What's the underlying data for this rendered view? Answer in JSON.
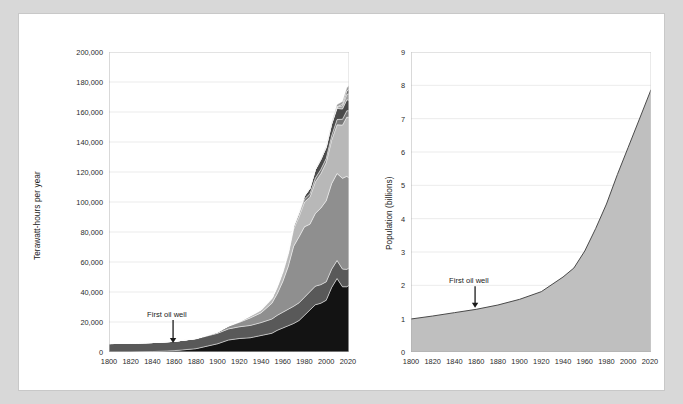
{
  "figure": {
    "background_color": "#d8d8d8",
    "panel_color": "#ffffff",
    "panel_border_color": "#c8c8c8"
  },
  "chart_data": [
    {
      "id": "energy",
      "type": "area",
      "stacked": true,
      "title": "",
      "xlabel": "",
      "ylabel": "Terawatt-hours per year",
      "xlim": [
        1800,
        2021
      ],
      "ylim": [
        0,
        200000
      ],
      "grid": true,
      "legend": "none",
      "xticks": [
        1800,
        1820,
        1840,
        1860,
        1880,
        1900,
        1920,
        1940,
        1960,
        1980,
        2000,
        2020
      ],
      "xticklabels": [
        "1800",
        "1820",
        "1840",
        "1860",
        "1880",
        "1900",
        "1920",
        "1940",
        "1960",
        "1980",
        "2000",
        "2020"
      ],
      "yticks": [
        0,
        20000,
        40000,
        60000,
        80000,
        100000,
        120000,
        140000,
        160000,
        180000,
        200000
      ],
      "yticklabels": [
        "0",
        "20,000",
        "40,000",
        "60,000",
        "80,000",
        "100,000",
        "120,000",
        "140,000",
        "160,000",
        "180,000",
        "200,000"
      ],
      "annotations": [
        {
          "text": "First oil well",
          "x": 1859,
          "y": 22000,
          "arrow": "down",
          "arrow_to_y": 6000
        }
      ],
      "x": [
        1800,
        1820,
        1840,
        1860,
        1880,
        1900,
        1910,
        1920,
        1930,
        1940,
        1950,
        1955,
        1960,
        1965,
        1970,
        1975,
        1980,
        1985,
        1990,
        1995,
        2000,
        2005,
        2010,
        2015,
        2019,
        2021
      ],
      "series": [
        {
          "name": "Coal",
          "color": "#131313",
          "values": [
            0,
            50,
            300,
            900,
            2200,
            5500,
            8000,
            9000,
            9500,
            11000,
            12500,
            14500,
            16000,
            17500,
            19000,
            21000,
            24500,
            28000,
            31500,
            32500,
            34500,
            43000,
            49000,
            43500,
            43500,
            44500
          ]
        },
        {
          "name": "Traditional biomass",
          "color": "#595959",
          "values": [
            5600,
            5800,
            6000,
            6200,
            6600,
            7000,
            7400,
            7800,
            8200,
            8600,
            9500,
            10000,
            10500,
            11000,
            11500,
            11800,
            12000,
            12200,
            12400,
            12400,
            12300,
            12200,
            12000,
            11800,
            11600,
            11500
          ]
        },
        {
          "name": "Oil",
          "color": "#8f8f8f",
          "values": [
            0,
            0,
            0,
            20,
            200,
            800,
            1800,
            3000,
            5000,
            6500,
            10500,
            14500,
            20500,
            28500,
            40000,
            44000,
            47000,
            45000,
            48500,
            51000,
            54000,
            57000,
            58000,
            60500,
            62000,
            60000
          ]
        },
        {
          "name": "Gas",
          "color": "#b8b8b8",
          "values": [
            0,
            0,
            0,
            0,
            20,
            90,
            250,
            500,
            1200,
            1700,
            2800,
            4200,
            5800,
            8000,
            11500,
            13500,
            16500,
            18000,
            21000,
            23000,
            25500,
            29000,
            32500,
            35500,
            39500,
            40500
          ]
        },
        {
          "name": "Hydropower",
          "color": "#787878",
          "values": [
            0,
            0,
            0,
            0,
            0,
            30,
            80,
            150,
            300,
            420,
            620,
            800,
            1050,
            1300,
            1600,
            1850,
            2050,
            2300,
            2550,
            2700,
            2800,
            3000,
            3500,
            3900,
            4250,
            4350
          ]
        },
        {
          "name": "Nuclear",
          "color": "#4a4a4a",
          "values": [
            0,
            0,
            0,
            0,
            0,
            0,
            0,
            0,
            0,
            0,
            0,
            10,
            60,
            180,
            500,
            1100,
            1900,
            3500,
            5500,
            6600,
            7300,
            7600,
            7400,
            6800,
            7300,
            7000
          ]
        },
        {
          "name": "Wind",
          "color": "#a0a0a0",
          "values": [
            0,
            0,
            0,
            0,
            0,
            0,
            0,
            0,
            0,
            0,
            0,
            0,
            0,
            0,
            0,
            0,
            0,
            0,
            10,
            30,
            90,
            280,
            900,
            2100,
            3600,
            4400
          ]
        },
        {
          "name": "Solar",
          "color": "#6b6b6b",
          "values": [
            0,
            0,
            0,
            0,
            0,
            0,
            0,
            0,
            0,
            0,
            0,
            0,
            0,
            0,
            0,
            0,
            0,
            0,
            0,
            5,
            10,
            50,
            250,
            1000,
            2200,
            2900
          ]
        },
        {
          "name": "Other renewables",
          "color": "#9a9a9a",
          "values": [
            0,
            0,
            0,
            0,
            0,
            0,
            0,
            0,
            0,
            0,
            0,
            0,
            0,
            0,
            0,
            20,
            60,
            130,
            250,
            400,
            600,
            900,
            1400,
            1900,
            2300,
            2500
          ]
        }
      ]
    },
    {
      "id": "population",
      "type": "area",
      "stacked": false,
      "title": "",
      "xlabel": "",
      "ylabel": "Population (billions)",
      "xlim": [
        1800,
        2021
      ],
      "ylim": [
        0,
        9
      ],
      "grid": true,
      "legend": "none",
      "fill_color": "#bfbfbf",
      "line_color": "#4a4a4a",
      "xticks": [
        1800,
        1820,
        1840,
        1860,
        1880,
        1900,
        1920,
        1940,
        1960,
        1980,
        2000,
        2020
      ],
      "xticklabels": [
        "1800",
        "1820",
        "1840",
        "1860",
        "1880",
        "1900",
        "1920",
        "1940",
        "1960",
        "1980",
        "2000",
        "2020"
      ],
      "yticks": [
        0,
        1,
        2,
        3,
        4,
        5,
        6,
        7,
        8,
        9
      ],
      "yticklabels": [
        "0",
        "1",
        "2",
        "3",
        "4",
        "5",
        "6",
        "7",
        "8",
        "9"
      ],
      "annotations": [
        {
          "text": "First oil well",
          "x": 1859,
          "y": 2.0,
          "arrow": "down",
          "arrow_to_y": 1.33
        }
      ],
      "x": [
        1800,
        1820,
        1840,
        1860,
        1880,
        1900,
        1920,
        1940,
        1950,
        1960,
        1970,
        1980,
        1990,
        2000,
        2010,
        2021
      ],
      "values": [
        0.99,
        1.08,
        1.18,
        1.28,
        1.41,
        1.58,
        1.81,
        2.25,
        2.52,
        3.03,
        3.7,
        4.44,
        5.32,
        6.14,
        6.96,
        7.87
      ]
    }
  ]
}
